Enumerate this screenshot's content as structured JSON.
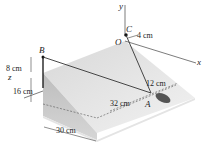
{
  "diagram": {
    "axes": {
      "x": "x",
      "y": "y",
      "z": "z"
    },
    "points": {
      "origin": "O",
      "B": "B",
      "C": "C",
      "A": "A"
    },
    "dimensions": {
      "oc_offset": "4 cm",
      "b_height": "8 cm",
      "z_depth": "16 cm",
      "base_width": "30 cm",
      "a_to_edge": "32 cm",
      "a_offset": "12 cm"
    },
    "colors": {
      "slab_top": "#e6e6e6",
      "slab_side": "#c9c9c9",
      "line": "#333333",
      "object": "#555555"
    }
  }
}
